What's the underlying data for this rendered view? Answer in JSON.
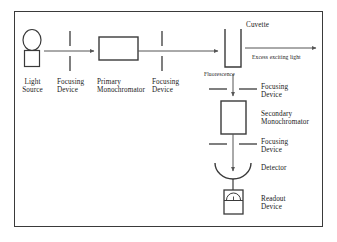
{
  "diagram": {
    "frame": {
      "stroke": "#3a3a3a"
    },
    "line_color": "#555555",
    "shape_stroke": "#3a3a3a",
    "components": {
      "light_source": {
        "label_line1": "Light",
        "label_line2": "Source"
      },
      "focusing_device_1": {
        "label_line1": "Focusing",
        "label_line2": "Device"
      },
      "primary_monochromator": {
        "label_line1": "Primary",
        "label_line2": "Monochromator"
      },
      "focusing_device_2": {
        "label_line1": "Focusing",
        "label_line2": "Device"
      },
      "cuvette": {
        "label": "Cuvette"
      },
      "excess_light": {
        "label": "Excess exciting light"
      },
      "fluorescence": {
        "label": "Fluorescence"
      },
      "focusing_device_3": {
        "label_line1": "Focusing",
        "label_line2": "Device"
      },
      "secondary_monochromator": {
        "label_line1": "Secondary",
        "label_line2": "Monochromator"
      },
      "focusing_device_4": {
        "label_line1": "Focusing",
        "label_line2": "Device"
      },
      "detector": {
        "label": "Detector"
      },
      "readout_device": {
        "label_line1": "Readout",
        "label_line2": "Device"
      }
    }
  }
}
